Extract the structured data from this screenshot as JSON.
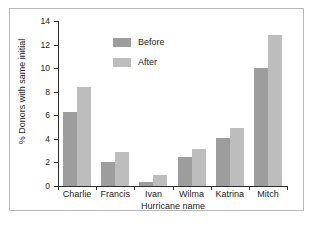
{
  "chart_data": {
    "type": "bar",
    "title": "",
    "subtitle": "",
    "xlabel": "Hurricane name",
    "ylabel": "% Donors with same initial",
    "categories": [
      "Charlie",
      "Francis",
      "Ivan",
      "Wilma",
      "Katrina",
      "Mitch"
    ],
    "series": [
      {
        "name": "Before",
        "color": "#9d9d9d",
        "values": [
          6.3,
          2.0,
          0.3,
          2.5,
          4.1,
          10.0
        ]
      },
      {
        "name": "After",
        "color": "#bdbdbd",
        "values": [
          8.4,
          2.9,
          0.9,
          3.1,
          4.9,
          12.8
        ]
      }
    ],
    "ylim": [
      0,
      14
    ],
    "ytick_labels": [
      "0",
      "2",
      "4",
      "6",
      "8",
      "10",
      "12",
      "14"
    ],
    "ytick_values": [
      0,
      2,
      4,
      6,
      8,
      10,
      12,
      14
    ],
    "grid": false,
    "legend_position": "upper-center",
    "axis_color": "#2b2b2b",
    "frame_color": "#b9b9b9",
    "background_color": "#ffffff"
  }
}
